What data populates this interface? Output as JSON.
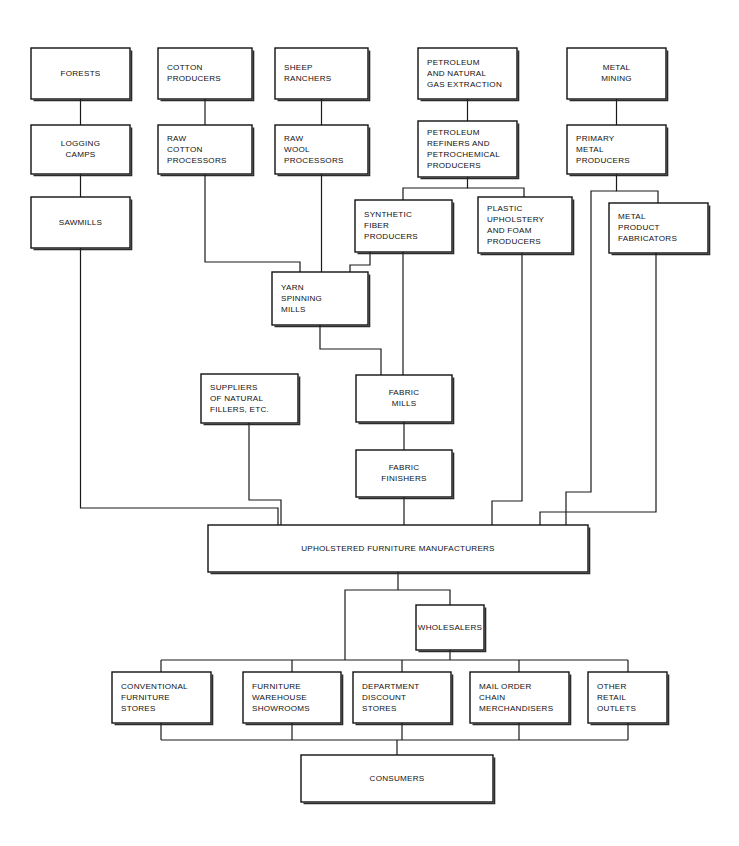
{
  "diagram": {
    "background_color": "#ffffff",
    "line_color": "#1a1a1a",
    "text_color": "#111111",
    "box_fill": "#ffffff"
  },
  "nodes": [
    {
      "id": "forests",
      "label": "FORESTS",
      "lines": [
        "FORESTS"
      ],
      "x": 31,
      "y": 48,
      "w": 99,
      "h": 51,
      "align": "center"
    },
    {
      "id": "cotton_prod",
      "label": "COTTON PRODUCERS",
      "lines": [
        "COTTON",
        "PRODUCERS"
      ],
      "x": 158,
      "y": 48,
      "w": 94,
      "h": 51,
      "align": "left"
    },
    {
      "id": "sheep_ranch",
      "label": "SHEEP RANCHERS",
      "lines": [
        "SHEEP",
        "RANCHERS"
      ],
      "x": 275,
      "y": 48,
      "w": 93,
      "h": 51,
      "align": "left"
    },
    {
      "id": "petroleum_ext",
      "label": "PETROLEUM AND NATURAL GAS EXTRACTION",
      "lines": [
        "PETROLEUM",
        "AND NATURAL",
        "GAS EXTRACTION"
      ],
      "x": 418,
      "y": 48,
      "w": 99,
      "h": 51,
      "align": "left"
    },
    {
      "id": "metal_mining",
      "label": "METAL MINING",
      "lines": [
        "METAL",
        "MINING"
      ],
      "x": 567,
      "y": 48,
      "w": 99,
      "h": 51,
      "align": "center"
    },
    {
      "id": "logging",
      "label": "LOGGING CAMPS",
      "lines": [
        "LOGGING",
        "CAMPS"
      ],
      "x": 31,
      "y": 125,
      "w": 99,
      "h": 49,
      "align": "center"
    },
    {
      "id": "raw_cotton",
      "label": "RAW COTTON PROCESSORS",
      "lines": [
        "RAW",
        "COTTON",
        "PROCESSORS"
      ],
      "x": 158,
      "y": 125,
      "w": 94,
      "h": 49,
      "align": "left"
    },
    {
      "id": "raw_wool",
      "label": "RAW WOOL PROCESSORS",
      "lines": [
        "RAW",
        "WOOL",
        "PROCESSORS"
      ],
      "x": 275,
      "y": 125,
      "w": 93,
      "h": 49,
      "align": "left"
    },
    {
      "id": "petro_refiners",
      "label": "PETROLEUM REFINERS AND PETROCHEMICAL PRODUCERS",
      "lines": [
        "PETROLEUM",
        "REFINERS AND",
        "PETROCHEMICAL",
        "PRODUCERS"
      ],
      "x": 418,
      "y": 121,
      "w": 99,
      "h": 56,
      "align": "left"
    },
    {
      "id": "primary_metal",
      "label": "PRIMARY METAL PRODUCERS",
      "lines": [
        "PRIMARY",
        "METAL",
        "PRODUCERS"
      ],
      "x": 567,
      "y": 125,
      "w": 99,
      "h": 49,
      "align": "left"
    },
    {
      "id": "sawmills",
      "label": "SAWMILLS",
      "lines": [
        "SAWMILLS"
      ],
      "x": 31,
      "y": 197,
      "w": 99,
      "h": 51,
      "align": "center"
    },
    {
      "id": "synth_fiber",
      "label": "SYNTHETIC FIBER PRODUCERS",
      "lines": [
        "SYNTHETIC",
        "FIBER",
        "PRODUCERS"
      ],
      "x": 355,
      "y": 200,
      "w": 97,
      "h": 52,
      "align": "left"
    },
    {
      "id": "plastic_uph",
      "label": "PLASTIC UPHOLSTERY AND FOAM PRODUCERS",
      "lines": [
        "PLASTIC",
        "UPHOLSTERY",
        "AND FOAM",
        "PRODUCERS"
      ],
      "x": 478,
      "y": 197,
      "w": 94,
      "h": 56,
      "align": "left"
    },
    {
      "id": "metal_fab",
      "label": "METAL PRODUCT FABRICATORS",
      "lines": [
        "METAL",
        "PRODUCT",
        "FABRICATORS"
      ],
      "x": 609,
      "y": 203,
      "w": 99,
      "h": 50,
      "align": "left"
    },
    {
      "id": "yarn_mills",
      "label": "YARN SPINNING MILLS",
      "lines": [
        "YARN",
        "SPINNING",
        "MILLS"
      ],
      "x": 272,
      "y": 272,
      "w": 96,
      "h": 53,
      "align": "left"
    },
    {
      "id": "suppliers",
      "label": "SUPPLIERS OF NATURAL FILLERS, ETC.",
      "lines": [
        "SUPPLIERS",
        "OF NATURAL",
        "FILLERS, ETC."
      ],
      "x": 201,
      "y": 374,
      "w": 97,
      "h": 49,
      "align": "left"
    },
    {
      "id": "fabric_mills",
      "label": "FABRIC MILLS",
      "lines": [
        "FABRIC",
        "MILLS"
      ],
      "x": 356,
      "y": 375,
      "w": 96,
      "h": 47,
      "align": "center"
    },
    {
      "id": "fabric_finish",
      "label": "FABRIC FINISHERS",
      "lines": [
        "FABRIC",
        "FINISHERS"
      ],
      "x": 356,
      "y": 450,
      "w": 96,
      "h": 47,
      "align": "center"
    },
    {
      "id": "manufacturers",
      "label": "UPHOLSTERED FURNITURE MANUFACTURERS",
      "lines": [
        "UPHOLSTERED FURNITURE MANUFACTURERS"
      ],
      "x": 208,
      "y": 525,
      "w": 380,
      "h": 47,
      "align": "center"
    },
    {
      "id": "wholesalers",
      "label": "WHOLESALERS",
      "lines": [
        "WHOLESALERS"
      ],
      "x": 416,
      "y": 605,
      "w": 68,
      "h": 45,
      "align": "center"
    },
    {
      "id": "conv_furn",
      "label": "CONVENTIONAL FURNITURE STORES",
      "lines": [
        "CONVENTIONAL",
        "FURNITURE",
        "STORES"
      ],
      "x": 112,
      "y": 672,
      "w": 99,
      "h": 51,
      "align": "left"
    },
    {
      "id": "furn_ware",
      "label": "FURNITURE WAREHOUSE SHOWROOMS",
      "lines": [
        "FURNITURE",
        "WAREHOUSE",
        "SHOWROOMS"
      ],
      "x": 243,
      "y": 672,
      "w": 98,
      "h": 51,
      "align": "left"
    },
    {
      "id": "dept_disc",
      "label": "DEPARTMENT DISCOUNT STORES",
      "lines": [
        "DEPARTMENT",
        "DISCOUNT",
        "STORES"
      ],
      "x": 353,
      "y": 672,
      "w": 98,
      "h": 51,
      "align": "left"
    },
    {
      "id": "mail_order",
      "label": "MAIL ORDER CHAIN MERCHANDISERS",
      "lines": [
        "MAIL ORDER",
        "CHAIN",
        "MERCHANDISERS"
      ],
      "x": 470,
      "y": 672,
      "w": 99,
      "h": 51,
      "align": "left"
    },
    {
      "id": "other_retail",
      "label": "OTHER RETAIL OUTLETS",
      "lines": [
        "OTHER",
        "RETAIL",
        "OUTLETS"
      ],
      "x": 588,
      "y": 672,
      "w": 79,
      "h": 51,
      "align": "left"
    },
    {
      "id": "consumers",
      "label": "CONSUMERS",
      "lines": [
        "CONSUMERS"
      ],
      "x": 301,
      "y": 755,
      "w": 192,
      "h": 47,
      "align": "center"
    }
  ],
  "connectors": [
    {
      "id": "forests-logging",
      "from": "forests",
      "to": "logging",
      "path": "M 80.5 99 L 80.5 125"
    },
    {
      "id": "logging-sawmills",
      "from": "logging",
      "to": "sawmills",
      "path": "M 80.5 174 L 80.5 197"
    },
    {
      "id": "sawmills-manufacturers",
      "from": "sawmills",
      "to": "manufacturers",
      "path": "M 80.5 248 L 80.5 508 L 278 508 L 278 525"
    },
    {
      "id": "cottonprod-rawcotton",
      "from": "cotton_prod",
      "to": "raw_cotton",
      "path": "M 205 99 L 205 125"
    },
    {
      "id": "rawcotton-yarn",
      "from": "raw_cotton",
      "to": "yarn_mills",
      "path": "M 205 174 L 205 262 L 300 262 L 300 272"
    },
    {
      "id": "sheep-rawwool",
      "from": "sheep_ranch",
      "to": "raw_wool",
      "path": "M 321.5 99 L 321.5 125"
    },
    {
      "id": "rawwool-yarn",
      "from": "raw_wool",
      "to": "yarn_mills",
      "path": "M 321.5 174 L 321.5 272"
    },
    {
      "id": "petro-refiners",
      "from": "petroleum_ext",
      "to": "petro_refiners",
      "path": "M 467.5 99 L 467.5 121"
    },
    {
      "id": "refiners-synth",
      "from": "petro_refiners",
      "to": "synth_fiber",
      "path": "M 467.5 177 L 467.5 188 L 403 188 L 403 200"
    },
    {
      "id": "refiners-plastic",
      "from": "petro_refiners",
      "to": "plastic_uph",
      "path": "M 467.5 188 L 524 188 L 524 197"
    },
    {
      "id": "metalmining-primary",
      "from": "metal_mining",
      "to": "primary_metal",
      "path": "M 616.5 99 L 616.5 125"
    },
    {
      "id": "primary-metalfab",
      "from": "primary_metal",
      "to": "metal_fab",
      "path": "M 616.5 174 L 616.5 191 L 658 191 L 658 203"
    },
    {
      "id": "primary-manufacturers",
      "from": "primary_metal",
      "to": "manufacturers",
      "path": "M 616.5 191 L 591 191 L 591 492 L 566 492 L 566 525"
    },
    {
      "id": "synth-yarn",
      "from": "synth_fiber",
      "to": "yarn_mills",
      "path": "M 370 252 L 370 265 L 350 265 L 350 272"
    },
    {
      "id": "synth-fabricmills",
      "from": "synth_fiber",
      "to": "fabric_mills",
      "path": "M 403 252 L 403 375"
    },
    {
      "id": "yarn-fabricmills",
      "from": "yarn_mills",
      "to": "fabric_mills",
      "path": "M 320 325 L 320 349 L 381 349 L 381 375"
    },
    {
      "id": "fabricmills-finishers",
      "from": "fabric_mills",
      "to": "fabric_finish",
      "path": "M 404 422 L 404 450"
    },
    {
      "id": "finishers-manufacturers",
      "from": "fabric_finish",
      "to": "manufacturers",
      "path": "M 404 497 L 404 525"
    },
    {
      "id": "suppliers-manufacturers",
      "from": "suppliers",
      "to": "manufacturers",
      "path": "M 249 423 L 249 500 L 281 500 L 281 525"
    },
    {
      "id": "plastic-manufacturers",
      "from": "plastic_uph",
      "to": "manufacturers",
      "path": "M 522 253 L 522 501 L 492 501 L 492 525"
    },
    {
      "id": "metalfab-manufacturers",
      "from": "metal_fab",
      "to": "manufacturers",
      "path": "M 656 253 L 656 512 L 540 512 L 540 525"
    },
    {
      "id": "manufacturers-trunk",
      "from": "manufacturers",
      "to": "retail_bar",
      "path": "M 398 572 L 398 590"
    },
    {
      "id": "manufacturers-wholesalers",
      "from": "manufacturers",
      "to": "wholesalers",
      "path": "M 398 590 L 450 590 L 450 605"
    },
    {
      "id": "manufacturers-direct",
      "from": "manufacturers",
      "to": "retail_bar",
      "path": "M 398 590 L 345 590 L 345 660"
    },
    {
      "id": "wholesalers-bar",
      "from": "wholesalers",
      "to": "retail_bar",
      "path": "M 450 650 L 450 660"
    },
    {
      "id": "retail-bar",
      "from": "retail_bar",
      "to": "retailers",
      "path": "M 161 660 L 628 660"
    },
    {
      "id": "bar-conv",
      "from": "retail_bar",
      "to": "conv_furn",
      "path": "M 161 660 L 161 672"
    },
    {
      "id": "bar-furnware",
      "from": "retail_bar",
      "to": "furn_ware",
      "path": "M 292 660 L 292 672"
    },
    {
      "id": "bar-deptdisc",
      "from": "retail_bar",
      "to": "dept_disc",
      "path": "M 402 660 L 402 672"
    },
    {
      "id": "bar-mailorder",
      "from": "retail_bar",
      "to": "mail_order",
      "path": "M 519 660 L 519 672"
    },
    {
      "id": "bar-otherretail",
      "from": "retail_bar",
      "to": "other_retail",
      "path": "M 628 660 L 628 672"
    },
    {
      "id": "conv-consumers",
      "from": "conv_furn",
      "to": "consumers_bar",
      "path": "M 161 723 L 161 740"
    },
    {
      "id": "furnware-consumers",
      "from": "furn_ware",
      "to": "consumers_bar",
      "path": "M 292 723 L 292 740"
    },
    {
      "id": "deptdisc-consumers",
      "from": "dept_disc",
      "to": "consumers_bar",
      "path": "M 402 723 L 402 740"
    },
    {
      "id": "mailorder-consumers",
      "from": "mail_order",
      "to": "consumers_bar",
      "path": "M 519 723 L 519 740"
    },
    {
      "id": "otherretail-consumers",
      "from": "other_retail",
      "to": "consumers_bar",
      "path": "M 628 723 L 628 740"
    },
    {
      "id": "consumers-bar",
      "from": "consumers_bar",
      "to": "consumers",
      "path": "M 161 740 L 628 740"
    },
    {
      "id": "bar-consumers",
      "from": "consumers_bar",
      "to": "consumers",
      "path": "M 397 740 L 397 755"
    }
  ]
}
